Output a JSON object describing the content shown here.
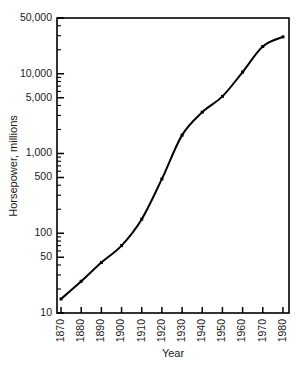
{
  "chart_data": {
    "type": "line",
    "title": "",
    "xlabel": "Year",
    "ylabel": "Horsepower, millions",
    "x": [
      1870,
      1880,
      1890,
      1900,
      1910,
      1920,
      1930,
      1940,
      1950,
      1960,
      1970,
      1980
    ],
    "values": [
      15,
      25,
      43,
      70,
      150,
      480,
      1700,
      3300,
      5200,
      10500,
      22000,
      29000
    ],
    "series": [
      {
        "name": "Horsepower",
        "values": [
          15,
          25,
          43,
          70,
          150,
          480,
          1700,
          3300,
          5200,
          10500,
          22000,
          29000
        ]
      }
    ],
    "xlim": [
      1868,
      1983
    ],
    "ylim": [
      10,
      50000
    ],
    "yscale": "log",
    "xscale": "linear",
    "grid": false,
    "legend": false,
    "legend_position": "none",
    "line_color": "#000000",
    "marker": "square",
    "y_tick_labels": [
      "10",
      "50",
      "100",
      "500",
      "1,000",
      "5,000",
      "10,000",
      "50,000"
    ],
    "y_tick_values": [
      10,
      50,
      100,
      500,
      1000,
      5000,
      10000,
      50000
    ],
    "y_minor_ticks": [
      20,
      30,
      40,
      60,
      70,
      80,
      90,
      200,
      300,
      400,
      600,
      700,
      800,
      900,
      2000,
      3000,
      4000,
      6000,
      7000,
      8000,
      9000,
      20000,
      30000,
      40000
    ],
    "x_tick_labels": [
      "1870",
      "1880",
      "1890",
      "1900",
      "1910",
      "1920",
      "1930",
      "1940",
      "1950",
      "1960",
      "1970",
      "1980"
    ],
    "x_tick_values": [
      1870,
      1880,
      1890,
      1900,
      1910,
      1920,
      1930,
      1940,
      1950,
      1960,
      1970,
      1980
    ],
    "x_label_rotation": -90
  }
}
